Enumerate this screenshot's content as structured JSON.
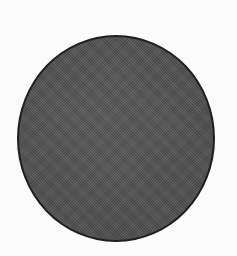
{
  "image": {
    "background_color": "#fbfbfb",
    "shape": {
      "type": "circle",
      "fill_color": "#575757",
      "border_color": "#1e1e1e",
      "border_width": 2,
      "bounds": {
        "x": 17,
        "y": 35,
        "width": 198,
        "height": 207
      },
      "texture": "noise"
    }
  }
}
